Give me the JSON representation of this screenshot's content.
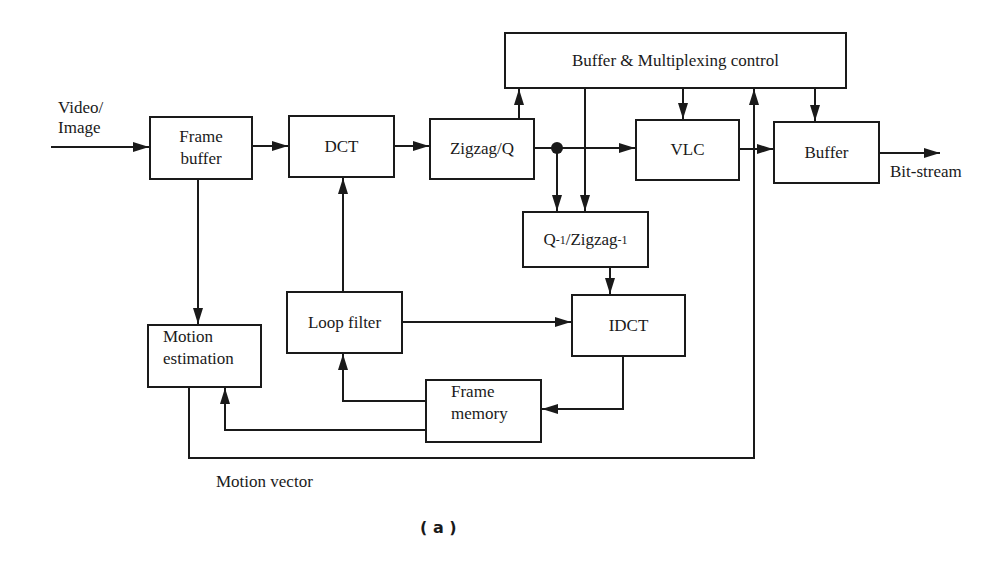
{
  "diagram": {
    "caption": "( a )",
    "input_label_line1": "Video/",
    "input_label_line2": "Image",
    "output_label": "Bit-stream",
    "motion_vector_label": "Motion vector",
    "blocks": {
      "frame_buffer": {
        "line1": "Frame",
        "line2": "buffer"
      },
      "dct": "DCT",
      "zigzag_q": "Zigzag/Q",
      "buffer_mux_control": "Buffer & Multiplexing control",
      "vlc": "VLC",
      "buffer": "Buffer",
      "inverse_q_zigzag": {
        "q": "Q",
        "q_sup": "-1",
        "zigzag": "/Zigzag",
        "zigzag_sup": "-1"
      },
      "idct": "IDCT",
      "loop_filter": "Loop filter",
      "motion_estimation": {
        "line1": "Motion",
        "line2": "estimation"
      },
      "frame_memory": {
        "line1": "Frame",
        "line2": "memory"
      }
    },
    "connections": [
      "Video/Image -> Frame buffer",
      "Frame buffer -> DCT",
      "DCT -> Zigzag/Q",
      "Zigzag/Q -> VLC",
      "Zigzag/Q -> Buffer & Multiplexing control",
      "Zigzag/Q -> Q-1/Zigzag-1",
      "Buffer & Multiplexing control -> Q-1/Zigzag-1",
      "Buffer & Multiplexing control -> VLC",
      "Buffer & Multiplexing control -> Buffer",
      "VLC -> Buffer",
      "Buffer -> Bit-stream",
      "Q-1/Zigzag-1 -> IDCT",
      "Loop filter -> IDCT",
      "Loop filter -> DCT",
      "IDCT -> Frame memory",
      "Frame memory -> Loop filter",
      "Frame memory -> Motion estimation",
      "Frame buffer -> Motion estimation",
      "Motion estimation -> Buffer & Multiplexing control (Motion vector)"
    ]
  }
}
